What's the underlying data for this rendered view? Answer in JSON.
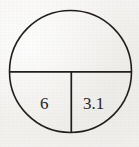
{
  "figure": {
    "kind": "geometry-diagram",
    "background_color": "#f4f3f1",
    "stroke_color": "#1f1c1b",
    "text_color": "#262322",
    "circle": {
      "center_x": 70.5,
      "center_y": 71.5,
      "radius": 61,
      "stroke_width": 1.6
    },
    "diameter_line": {
      "name": "horizontal-diameter",
      "x1": 9.5,
      "y1": 71.8,
      "x2": 131.5,
      "y2": 71.8,
      "stroke_width": 1.7
    },
    "radius_line": {
      "name": "vertical-radius",
      "x1": 71.3,
      "y1": 71.8,
      "x2": 71.3,
      "y2": 133.0,
      "stroke_width": 1.7
    },
    "labels": [
      {
        "id": "left",
        "text": "6",
        "x": 40,
        "y": 95,
        "font_size": 17
      },
      {
        "id": "right",
        "text": "3.1",
        "x": 83,
        "y": 95,
        "font_size": 17
      }
    ]
  }
}
